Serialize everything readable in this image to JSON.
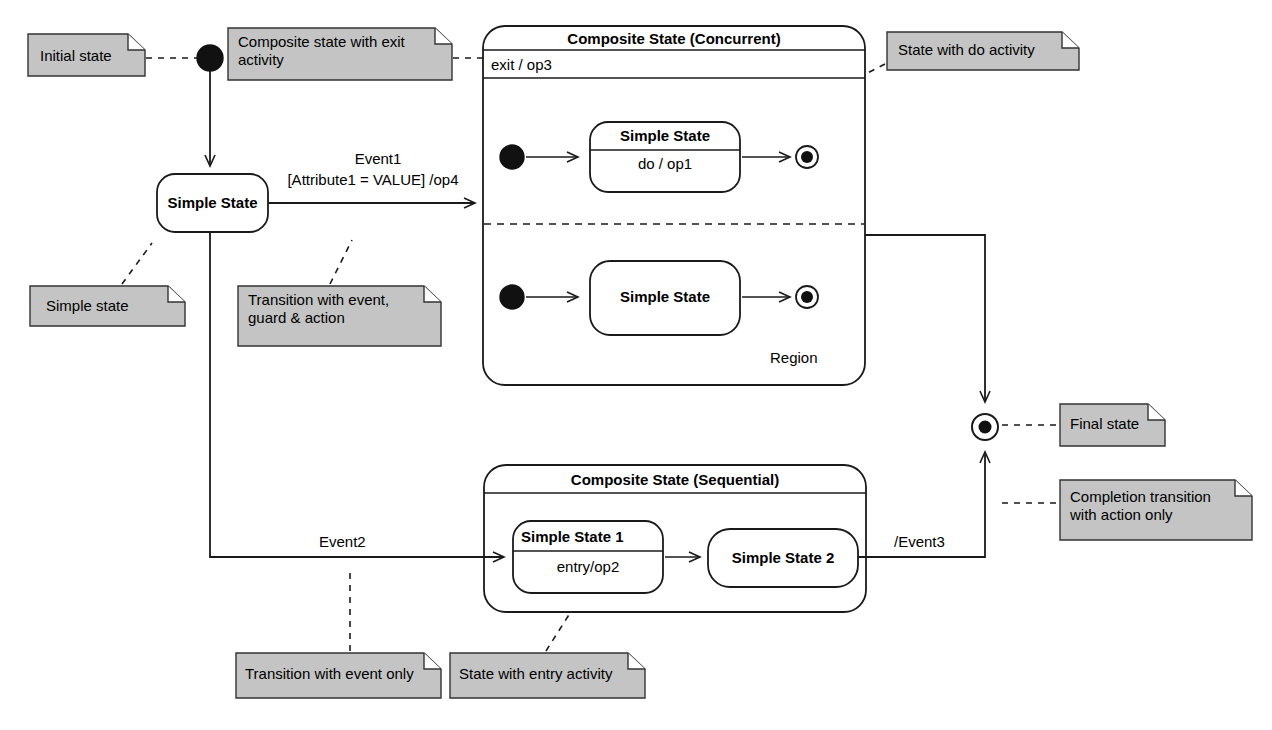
{
  "diagram": {
    "type": "uml-state-machine-diagram",
    "background": "#ffffff",
    "line_color": "#1a1a1a",
    "note_fill": "#c4c4c4",
    "note_border": "#333333"
  },
  "states": {
    "simple_state_left": {
      "label": "Simple State"
    },
    "concurrent": {
      "title": "Composite State (Concurrent)",
      "exit_activity": "exit / op3",
      "region_1": {
        "state_label": "Simple State",
        "state_activity": "do / op1"
      },
      "region_2": {
        "state_label": "Simple State"
      },
      "region_note": "Region"
    },
    "sequential": {
      "title": "Composite State (Sequential)",
      "state_1_label": "Simple State 1",
      "state_1_activity": "entry/op2",
      "state_2_label": "Simple State 2"
    }
  },
  "transitions": {
    "event1_line1": "Event1",
    "event1_line2": "[Attribute1 = VALUE] /op4",
    "event2": "Event2",
    "event3": "/Event3"
  },
  "notes": [
    {
      "id": "note-initial-state",
      "text": "Initial state"
    },
    {
      "id": "note-composite-exit-activity",
      "text": "Composite state with exit\nactivity"
    },
    {
      "id": "note-state-with-do-activity",
      "text": "State with do activity"
    },
    {
      "id": "note-simple-state",
      "text": "Simple state"
    },
    {
      "id": "note-transition-event-guard-action",
      "text": "Transition with event,\nguard & action"
    },
    {
      "id": "note-region",
      "text": "Region"
    },
    {
      "id": "note-final-state",
      "text": "Final state"
    },
    {
      "id": "note-completion-transition",
      "text": "Completion transition\nwith action only"
    },
    {
      "id": "note-transition-event-only",
      "text": "Transition with event only"
    },
    {
      "id": "note-state-entry-activity",
      "text": "State with entry activity"
    }
  ]
}
